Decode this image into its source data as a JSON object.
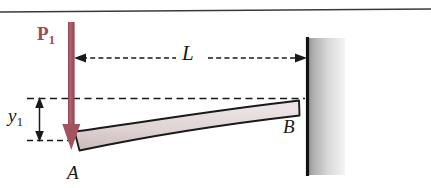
{
  "figure": {
    "kind": "engineering-mechanics-diagram",
    "background_color": "#ffffff",
    "top_rule_color": "#3a3a3a"
  },
  "labels": {
    "force": {
      "base": "P",
      "subscript": "1",
      "color": "#9e4a55"
    },
    "span": {
      "text": "L"
    },
    "deflection": {
      "base": "y",
      "subscript": "1"
    },
    "point_free_end": {
      "text": "A"
    },
    "point_fixed_end": {
      "text": "B"
    }
  },
  "beam": {
    "fill_light": "#e6dcdc",
    "fill_mid": "#cdbcbd",
    "outline_color": "#1a1a1a"
  },
  "wall": {
    "edge_color": "#111111",
    "hatch_light": "#ffffff",
    "hatch_dark": "#8c8c8c"
  },
  "force_arrow": {
    "color": "#a2535e",
    "direction": "down"
  },
  "dimension_lines": {
    "color": "#1a1a1a",
    "style": "dashed"
  }
}
